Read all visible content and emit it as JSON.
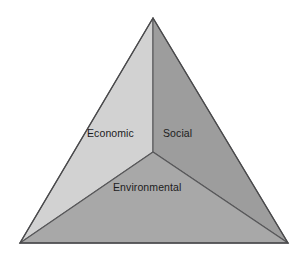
{
  "figure": {
    "background_color": "#ffffff"
  },
  "chart_data": {
    "type": "pie",
    "title": "",
    "subtitle": "",
    "xlabel": "",
    "ylabel": "",
    "legend_position": "none",
    "grid": false,
    "shape": "triangle",
    "categories": [
      "Economic",
      "Social",
      "Environmental"
    ],
    "values": [
      1,
      1,
      1
    ],
    "annotations": [
      "Economic",
      "Social",
      "Environmental"
    ],
    "segments": [
      {
        "label": "Economic",
        "position": "upper-left",
        "fill": "#d2d2d2",
        "stroke": "#58585a",
        "points": "153,18 153,152 20,243"
      },
      {
        "label": "Social",
        "position": "upper-right",
        "fill": "#9d9d9d",
        "stroke": "#58585a",
        "points": "153,18 288,243 153,152"
      },
      {
        "label": "Environmental",
        "position": "bottom",
        "fill": "#a8a8a8",
        "stroke": "#58585a",
        "points": "153,152 288,243 20,243"
      }
    ],
    "outline": {
      "points": "153,18 288,243 20,243",
      "stroke": "#4a4a4c",
      "stroke_width": 1.4
    },
    "vertices": {
      "apex": [
        153,
        18
      ],
      "bottom_left": [
        20,
        243
      ],
      "bottom_right": [
        288,
        243
      ],
      "centroid": [
        153,
        152
      ]
    }
  },
  "labels": {
    "economic": "Economic",
    "social": "Social",
    "environmental": "Environmental"
  },
  "colors": {
    "economic_fill": "#d2d2d2",
    "social_fill": "#9d9d9d",
    "environmental_fill": "#a8a8a8",
    "divider_stroke": "#58585a",
    "outline_stroke": "#4a4a4c",
    "text": "#1c1c1c",
    "background": "#ffffff"
  }
}
